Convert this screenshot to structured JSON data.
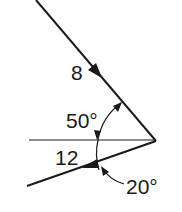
{
  "diagram": {
    "type": "force-vector-angle-diagram",
    "colors": {
      "stroke": "#1a1a1a",
      "background": "#ffffff"
    },
    "vectors": [
      {
        "id": "upper",
        "magnitude_label": "8",
        "direction": "toward vertex, down-right"
      },
      {
        "id": "lower",
        "magnitude_label": "12",
        "direction": "away from vertex, down-left"
      }
    ],
    "reference_line": "horizontal",
    "angles": [
      {
        "label": "50°",
        "between": "upper vector and horizontal"
      },
      {
        "label": "20°",
        "between": "lower vector and horizontal"
      }
    ]
  }
}
